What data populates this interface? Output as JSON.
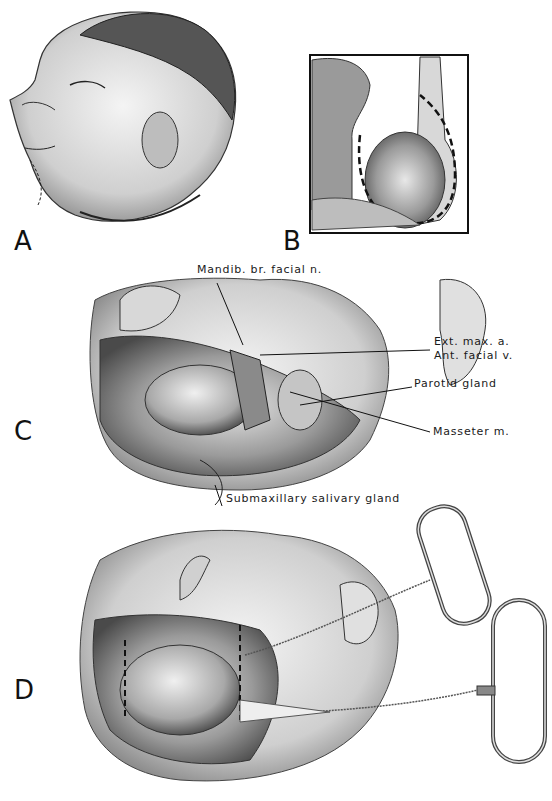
{
  "figure": {
    "panels": [
      {
        "id": "A",
        "letter": "A"
      },
      {
        "id": "B",
        "letter": "B"
      },
      {
        "id": "C",
        "letter": "C"
      },
      {
        "id": "D",
        "letter": "D"
      }
    ],
    "labels_panel_c": {
      "mandib_br": "Mandib. br. facial n.",
      "ext_max": "Ext. max. a.",
      "ant_facial": "Ant. facial v.",
      "parotid": "Parotid gland",
      "masseter": "Masseter m.",
      "submax": "Submaxillary salivary gland"
    },
    "colors": {
      "ink": "#111111",
      "shade": "#8a8a8a",
      "light": "#cfcfcf"
    }
  }
}
